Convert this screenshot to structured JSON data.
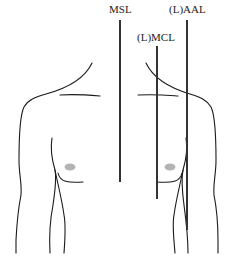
{
  "figure": {
    "type": "anatomical reference lines on anterior chest",
    "labels": {
      "msl": "MSL",
      "mcl": "(L)MCL",
      "aal": "(L)AAL"
    },
    "colors": {
      "outline": "#1a1a1a",
      "reference_line": "#333333",
      "nipple": "#b3b3b3",
      "background": "#ffffff"
    }
  }
}
